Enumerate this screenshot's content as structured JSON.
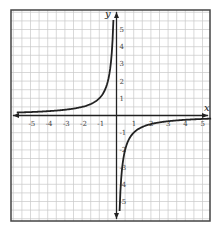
{
  "chart_data": {
    "type": "line",
    "title": "",
    "xlabel": "x",
    "ylabel": "y",
    "xlim": [
      -6,
      5.5
    ],
    "ylim": [
      -6,
      6
    ],
    "grid": true,
    "grid_step": 0.5,
    "x_ticks": [
      "-5",
      "-4",
      "-3",
      "-2",
      "-1",
      "1",
      "2",
      "3",
      "4",
      "5"
    ],
    "y_ticks": [
      "5",
      "4",
      "3",
      "2",
      "1",
      "-1",
      "-2",
      "-3",
      "-4",
      "-5"
    ],
    "function": "y = -1/x",
    "series": [
      {
        "name": "left-branch",
        "x": [
          -5.8,
          -5,
          -4,
          -3,
          -2,
          -1.5,
          -1,
          -0.75,
          -0.5,
          -0.3,
          -0.2
        ],
        "y": [
          0.17,
          0.2,
          0.25,
          0.33,
          0.5,
          0.67,
          1,
          1.33,
          2,
          3.33,
          5.5
        ]
      },
      {
        "name": "right-branch",
        "x": [
          0.2,
          0.3,
          0.5,
          0.75,
          1,
          1.5,
          2,
          3,
          4,
          5
        ],
        "y": [
          -5.5,
          -3.33,
          -2,
          -1.33,
          -1,
          -0.67,
          -0.5,
          -0.33,
          -0.25,
          -0.2
        ]
      }
    ],
    "colors": {
      "curve": "#222222",
      "grid": "#c8c8c8",
      "axis": "#222222",
      "border": "#444444"
    }
  }
}
